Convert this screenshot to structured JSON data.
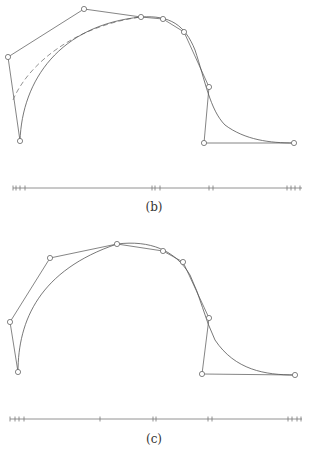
{
  "figure_b": {
    "caption": "(b)",
    "control_points": [
      [
        20,
        141
      ],
      [
        8,
        57
      ],
      [
        84,
        9
      ],
      [
        141,
        17
      ],
      [
        163,
        19
      ],
      [
        184,
        32
      ],
      [
        209,
        87
      ],
      [
        204,
        143
      ],
      [
        294,
        143
      ]
    ],
    "curve_path": "M20,141 C22,80 60,25 141,17 C170,15 185,25 195,50 C205,80 210,110 225,125 C245,140 270,143 294,143",
    "dashed_path": "M13,100 C30,60 80,25 141,17",
    "knot_line": {
      "y": 188,
      "x_start": 13,
      "x_end": 302
    },
    "knot_ticks": [
      13,
      16,
      20,
      25,
      152,
      155,
      160,
      209,
      213,
      287,
      291,
      295,
      300
    ]
  },
  "figure_c": {
    "caption": "(c)",
    "control_points": [
      [
        18,
        372
      ],
      [
        10,
        322
      ],
      [
        50,
        258
      ],
      [
        117,
        244
      ],
      [
        163,
        251
      ],
      [
        183,
        262
      ],
      [
        209,
        318
      ],
      [
        202,
        374
      ],
      [
        295,
        375
      ]
    ],
    "curve_path": "M18,372 C18,320 40,270 117,244 C150,240 175,250 190,275 C200,295 205,320 215,340 C235,370 265,375 295,375",
    "knot_line": {
      "y": 419,
      "x_start": 10,
      "x_end": 302
    },
    "knot_ticks": [
      10,
      15,
      19,
      24,
      100,
      153,
      156,
      208,
      212,
      288,
      292,
      297,
      301
    ]
  },
  "footer_fragment": "..."
}
